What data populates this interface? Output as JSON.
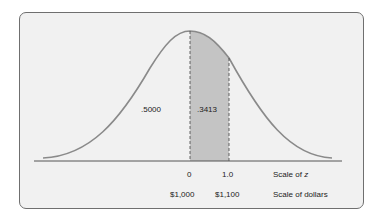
{
  "diagram": {
    "type": "normal-distribution",
    "areas": {
      "left_half": ".5000",
      "shaded": ".3413"
    },
    "z_scale": {
      "ticks": [
        "0",
        "1.0"
      ],
      "label": "Scale of ",
      "label_var": "z"
    },
    "dollar_scale": {
      "ticks": [
        "$1,000",
        "$1,100"
      ],
      "label": "Scale of dollars"
    },
    "colors": {
      "curve": "#8a8a8a",
      "shade": "#c4c4c4",
      "axis": "#555555",
      "background": "#f1f1f1"
    }
  }
}
